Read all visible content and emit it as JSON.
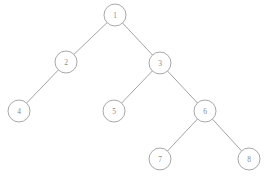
{
  "diagram": {
    "kind": "binary-tree",
    "title": "",
    "background_color": "#ffffff",
    "node_stroke_color": "#9e9e9e",
    "node_fill_color": "#ffffff",
    "edge_color": "#9a9a9a",
    "label_color": "#8a8a8a",
    "node_radius": 11,
    "nodes": [
      {
        "id": "1",
        "label": "1",
        "cx": 115,
        "cy": 15
      },
      {
        "id": "2",
        "label": "2",
        "cx": 66,
        "cy": 62
      },
      {
        "id": "3",
        "label": "3",
        "cx": 160,
        "cy": 63
      },
      {
        "id": "4",
        "label": "4",
        "cx": 19,
        "cy": 111
      },
      {
        "id": "5",
        "label": "5",
        "cx": 114,
        "cy": 111
      },
      {
        "id": "6",
        "label": "6",
        "cx": 205,
        "cy": 111
      },
      {
        "id": "7",
        "label": "7",
        "cx": 160,
        "cy": 159
      },
      {
        "id": "8",
        "label": "8",
        "cx": 249,
        "cy": 159
      }
    ],
    "edges": [
      {
        "from": "1",
        "to": "2",
        "side": "left"
      },
      {
        "from": "1",
        "to": "3",
        "side": "right"
      },
      {
        "from": "2",
        "to": "4",
        "side": "left"
      },
      {
        "from": "3",
        "to": "5",
        "side": "left"
      },
      {
        "from": "3",
        "to": "6",
        "side": "right"
      },
      {
        "from": "6",
        "to": "7",
        "side": "left"
      },
      {
        "from": "6",
        "to": "8",
        "side": "right"
      }
    ]
  }
}
